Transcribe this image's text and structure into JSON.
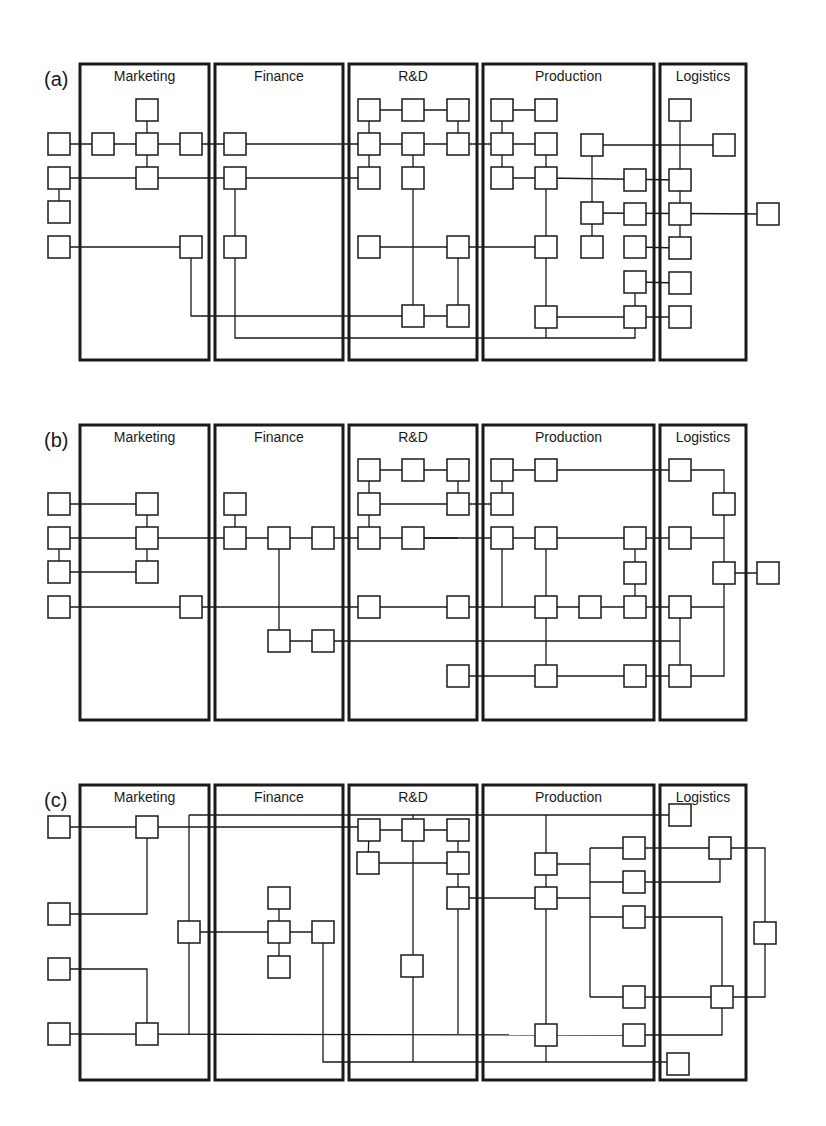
{
  "figure": {
    "width": 826,
    "height": 1126,
    "node_size": 22,
    "colors": {
      "stroke": "#1a1a1a",
      "background": "#ffffff"
    }
  },
  "departments": [
    {
      "id": "marketing",
      "label": "Marketing",
      "x1": 80,
      "x2": 209
    },
    {
      "id": "finance",
      "label": "Finance",
      "x1": 215,
      "x2": 343
    },
    {
      "id": "rnd",
      "label": "R&D",
      "x1": 349,
      "x2": 477
    },
    {
      "id": "production",
      "label": "Production",
      "x1": 483,
      "x2": 654
    },
    {
      "id": "logistics",
      "label": "Logistics",
      "x1": 660,
      "x2": 746
    }
  ],
  "panels": [
    {
      "id": "a",
      "label": "(a)",
      "y_top": 64,
      "y_bottom": 360,
      "nodes": [
        [
          59,
          144
        ],
        [
          59,
          178
        ],
        [
          59,
          212
        ],
        [
          59,
          247
        ],
        [
          103,
          144
        ],
        [
          147,
          110
        ],
        [
          147,
          144
        ],
        [
          147,
          178
        ],
        [
          191,
          144
        ],
        [
          191,
          247
        ],
        [
          235,
          144
        ],
        [
          235,
          178
        ],
        [
          235,
          247
        ],
        [
          369,
          110
        ],
        [
          413,
          110
        ],
        [
          458,
          110
        ],
        [
          369,
          144
        ],
        [
          413,
          144
        ],
        [
          458,
          144
        ],
        [
          369,
          178
        ],
        [
          413,
          178
        ],
        [
          369,
          247
        ],
        [
          458,
          247
        ],
        [
          413,
          316
        ],
        [
          458,
          316
        ],
        [
          502,
          110
        ],
        [
          546,
          110
        ],
        [
          502,
          144
        ],
        [
          546,
          144
        ],
        [
          502,
          178
        ],
        [
          546,
          178
        ],
        [
          592,
          145
        ],
        [
          592,
          213
        ],
        [
          592,
          247
        ],
        [
          635,
          180
        ],
        [
          635,
          214
        ],
        [
          635,
          247
        ],
        [
          635,
          282
        ],
        [
          635,
          317
        ],
        [
          546,
          247
        ],
        [
          546,
          317
        ],
        [
          680,
          110
        ],
        [
          680,
          180
        ],
        [
          680,
          214
        ],
        [
          680,
          248
        ],
        [
          680,
          283
        ],
        [
          680,
          317
        ],
        [
          724,
          145
        ],
        [
          768,
          214
        ]
      ],
      "edges": [
        [
          [
            59,
            144
          ],
          [
            235,
            144
          ]
        ],
        [
          [
            147,
            110
          ],
          [
            147,
            178
          ]
        ],
        [
          [
            59,
            178
          ],
          [
            59,
            212
          ]
        ],
        [
          [
            59,
            178
          ],
          [
            235,
            178
          ]
        ],
        [
          [
            59,
            247
          ],
          [
            191,
            247
          ]
        ],
        [
          [
            235,
            178
          ],
          [
            235,
            247
          ]
        ],
        [
          [
            235,
            144
          ],
          [
            458,
            144
          ]
        ],
        [
          [
            235,
            178
          ],
          [
            369,
            178
          ]
        ],
        [
          [
            369,
            110
          ],
          [
            458,
            110
          ]
        ],
        [
          [
            369,
            110
          ],
          [
            369,
            178
          ]
        ],
        [
          [
            458,
            110
          ],
          [
            458,
            144
          ]
        ],
        [
          [
            413,
            144
          ],
          [
            413,
            316
          ]
        ],
        [
          [
            369,
            247
          ],
          [
            546,
            247
          ]
        ],
        [
          [
            458,
            247
          ],
          [
            458,
            316
          ]
        ],
        [
          [
            191,
            247
          ],
          [
            191,
            316
          ],
          [
            458,
            316
          ]
        ],
        [
          [
            235,
            247
          ],
          [
            235,
            338
          ],
          [
            635,
            338
          ],
          [
            635,
            317
          ]
        ],
        [
          [
            458,
            144
          ],
          [
            546,
            144
          ]
        ],
        [
          [
            502,
            110
          ],
          [
            546,
            110
          ]
        ],
        [
          [
            502,
            110
          ],
          [
            502,
            178
          ]
        ],
        [
          [
            502,
            178
          ],
          [
            546,
            178
          ]
        ],
        [
          [
            546,
            144
          ],
          [
            546,
            338
          ]
        ],
        [
          [
            546,
            178
          ],
          [
            680,
            180
          ]
        ],
        [
          [
            592,
            145
          ],
          [
            592,
            247
          ]
        ],
        [
          [
            592,
            145
          ],
          [
            724,
            145
          ]
        ],
        [
          [
            592,
            213
          ],
          [
            768,
            214
          ]
        ],
        [
          [
            546,
            317
          ],
          [
            635,
            317
          ]
        ],
        [
          [
            635,
            247
          ],
          [
            680,
            248
          ]
        ],
        [
          [
            635,
            282
          ],
          [
            680,
            283
          ]
        ],
        [
          [
            635,
            282
          ],
          [
            635,
            317
          ]
        ],
        [
          [
            635,
            317
          ],
          [
            680,
            317
          ]
        ],
        [
          [
            680,
            110
          ],
          [
            680,
            248
          ]
        ]
      ]
    },
    {
      "id": "b",
      "label": "(b)",
      "y_top": 425,
      "y_bottom": 720,
      "nodes": [
        [
          59,
          504
        ],
        [
          59,
          538
        ],
        [
          59,
          572
        ],
        [
          59,
          607
        ],
        [
          147,
          504
        ],
        [
          147,
          538
        ],
        [
          147,
          572
        ],
        [
          191,
          607
        ],
        [
          235,
          504
        ],
        [
          235,
          538
        ],
        [
          279,
          538
        ],
        [
          323,
          538
        ],
        [
          279,
          641
        ],
        [
          323,
          641
        ],
        [
          369,
          470
        ],
        [
          413,
          470
        ],
        [
          458,
          470
        ],
        [
          369,
          504
        ],
        [
          458,
          504
        ],
        [
          369,
          538
        ],
        [
          413,
          538
        ],
        [
          369,
          607
        ],
        [
          458,
          607
        ],
        [
          458,
          676
        ],
        [
          502,
          470
        ],
        [
          546,
          470
        ],
        [
          502,
          504
        ],
        [
          502,
          538
        ],
        [
          546,
          538
        ],
        [
          635,
          538
        ],
        [
          635,
          573
        ],
        [
          546,
          607
        ],
        [
          590,
          607
        ],
        [
          635,
          607
        ],
        [
          546,
          676
        ],
        [
          635,
          676
        ],
        [
          680,
          470
        ],
        [
          724,
          504
        ],
        [
          680,
          538
        ],
        [
          724,
          573
        ],
        [
          680,
          607
        ],
        [
          680,
          676
        ],
        [
          768,
          573
        ]
      ],
      "edges": [
        [
          [
            59,
            504
          ],
          [
            147,
            504
          ]
        ],
        [
          [
            59,
            538
          ],
          [
            235,
            538
          ]
        ],
        [
          [
            59,
            538
          ],
          [
            59,
            572
          ]
        ],
        [
          [
            59,
            572
          ],
          [
            147,
            572
          ]
        ],
        [
          [
            147,
            504
          ],
          [
            147,
            572
          ]
        ],
        [
          [
            59,
            607
          ],
          [
            680,
            607
          ]
        ],
        [
          [
            235,
            504
          ],
          [
            235,
            538
          ]
        ],
        [
          [
            235,
            538
          ],
          [
            458,
            538
          ]
        ],
        [
          [
            279,
            538
          ],
          [
            279,
            641
          ]
        ],
        [
          [
            279,
            641
          ],
          [
            680,
            641
          ]
        ],
        [
          [
            369,
            470
          ],
          [
            458,
            470
          ]
        ],
        [
          [
            369,
            470
          ],
          [
            369,
            538
          ]
        ],
        [
          [
            458,
            470
          ],
          [
            458,
            504
          ]
        ],
        [
          [
            369,
            504
          ],
          [
            502,
            504
          ]
        ],
        [
          [
            502,
            470
          ],
          [
            502,
            504
          ]
        ],
        [
          [
            502,
            470
          ],
          [
            680,
            470
          ],
          [
            724,
            470
          ],
          [
            724,
            676
          ],
          [
            680,
            676
          ]
        ],
        [
          [
            413,
            538
          ],
          [
            680,
            538
          ]
        ],
        [
          [
            724,
            538
          ],
          [
            680,
            538
          ]
        ],
        [
          [
            502,
            538
          ],
          [
            502,
            607
          ]
        ],
        [
          [
            546,
            538
          ],
          [
            546,
            676
          ]
        ],
        [
          [
            635,
            538
          ],
          [
            635,
            607
          ]
        ],
        [
          [
            724,
            573
          ],
          [
            768,
            573
          ]
        ],
        [
          [
            724,
            607
          ],
          [
            680,
            607
          ]
        ],
        [
          [
            680,
            607
          ],
          [
            680,
            676
          ]
        ],
        [
          [
            458,
            676
          ],
          [
            680,
            676
          ]
        ]
      ]
    },
    {
      "id": "c",
      "label": "(c)",
      "y_top": 785,
      "y_bottom": 1080,
      "nodes": [
        [
          59,
          827
        ],
        [
          59,
          914
        ],
        [
          59,
          969
        ],
        [
          59,
          1034
        ],
        [
          147,
          827
        ],
        [
          147,
          1034
        ],
        [
          189,
          932
        ],
        [
          279,
          898
        ],
        [
          279,
          932
        ],
        [
          279,
          967
        ],
        [
          323,
          932
        ],
        [
          369,
          830
        ],
        [
          413,
          830
        ],
        [
          458,
          830
        ],
        [
          368,
          863
        ],
        [
          458,
          863
        ],
        [
          458,
          898
        ],
        [
          412,
          966
        ],
        [
          546,
          864
        ],
        [
          546,
          898
        ],
        [
          546,
          1035
        ],
        [
          634,
          848
        ],
        [
          634,
          882
        ],
        [
          634,
          917
        ],
        [
          634,
          997
        ],
        [
          634,
          1035
        ],
        [
          680,
          815
        ],
        [
          720,
          848
        ],
        [
          765,
          933
        ],
        [
          722,
          997
        ],
        [
          678,
          1064
        ]
      ],
      "edges": [
        [
          [
            59,
            827
          ],
          [
            369,
            827
          ]
        ],
        [
          [
            147,
            827
          ],
          [
            147,
            914
          ],
          [
            59,
            914
          ]
        ],
        [
          [
            59,
            969
          ],
          [
            147,
            969
          ],
          [
            147,
            1034
          ]
        ],
        [
          [
            59,
            1034
          ],
          [
            634,
            1035
          ]
        ],
        [
          [
            189,
            815
          ],
          [
            189,
            1034
          ]
        ],
        [
          [
            189,
            815
          ],
          [
            680,
            815
          ]
        ],
        [
          [
            189,
            932
          ],
          [
            323,
            932
          ]
        ],
        [
          [
            279,
            898
          ],
          [
            279,
            967
          ]
        ],
        [
          [
            323,
            932
          ],
          [
            323,
            1062
          ],
          [
            678,
            1062
          ]
        ],
        [
          [
            369,
            830
          ],
          [
            458,
            830
          ]
        ],
        [
          [
            369,
            830
          ],
          [
            368,
            863
          ]
        ],
        [
          [
            368,
            863
          ],
          [
            458,
            863
          ]
        ],
        [
          [
            413,
            815
          ],
          [
            413,
            1062
          ]
        ],
        [
          [
            458,
            830
          ],
          [
            458,
            898
          ]
        ],
        [
          [
            458,
            898
          ],
          [
            458,
            1034
          ]
        ],
        [
          [
            458,
            898
          ],
          [
            546,
            898
          ]
        ],
        [
          [
            546,
            815
          ],
          [
            546,
            1062
          ]
        ],
        [
          [
            546,
            864
          ],
          [
            590,
            864
          ]
        ],
        [
          [
            546,
            898
          ],
          [
            590,
            898
          ]
        ],
        [
          [
            590,
            848
          ],
          [
            590,
            997
          ]
        ],
        [
          [
            590,
            848
          ],
          [
            720,
            848
          ]
        ],
        [
          [
            590,
            882
          ],
          [
            720,
            882
          ],
          [
            720,
            848
          ]
        ],
        [
          [
            590,
            917
          ],
          [
            722,
            917
          ],
          [
            722,
            997
          ]
        ],
        [
          [
            590,
            997
          ],
          [
            765,
            997
          ],
          [
            765,
            848
          ],
          [
            720,
            848
          ]
        ],
        [
          [
            634,
            1035
          ],
          [
            722,
            1035
          ],
          [
            722,
            997
          ]
        ]
      ]
    }
  ]
}
